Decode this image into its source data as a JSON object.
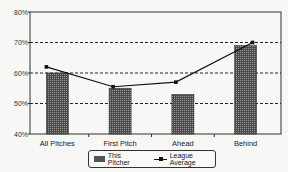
{
  "chart_data": {
    "type": "bar",
    "title": "",
    "xlabel": "",
    "ylabel": "",
    "categories": [
      "All Pitches",
      "First Pitch",
      "Ahead",
      "Behind"
    ],
    "series": [
      {
        "name": "This Pitcher",
        "type": "bar",
        "values": [
          60,
          55,
          53,
          69
        ]
      },
      {
        "name": "League Average",
        "type": "line",
        "values": [
          62,
          55.5,
          57,
          70
        ]
      }
    ],
    "yticks": [
      "40%",
      "50%",
      "60%",
      "70%",
      "80%"
    ],
    "ylim": [
      40,
      80
    ],
    "grid": {
      "horizontal_dashed": [
        50,
        60,
        70
      ]
    },
    "legend_position": "bottom"
  },
  "legend": {
    "bar_label": "This Pitcher",
    "line_label": "League Average"
  },
  "colors": {
    "bar": "#4a4a4a",
    "line": "#111111",
    "background": "#f7f7f5"
  }
}
